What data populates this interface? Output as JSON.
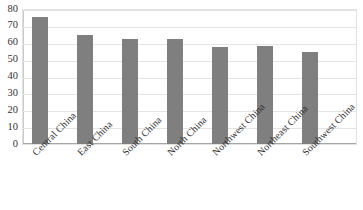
{
  "chart_data": {
    "type": "bar",
    "title": "",
    "xlabel": "",
    "ylabel": "",
    "categories": [
      "Central China",
      "East China",
      "South China",
      "North China",
      "Northwest China",
      "Northeast China",
      "Southwest China"
    ],
    "values": [
      75,
      64.5,
      62,
      62,
      57.5,
      58,
      54.5
    ],
    "ylim": [
      0,
      80
    ],
    "ytick_labels": [
      "80",
      "70",
      "60",
      "50",
      "40",
      "30",
      "20",
      "10",
      "0"
    ],
    "ytick_values": [
      80,
      70,
      60,
      50,
      40,
      30,
      20,
      10,
      0
    ],
    "grid": true,
    "legend": false,
    "bar_color": "#7f7f7f",
    "grid_color": "#e4e4e4",
    "axis_color": "#a6a6a6",
    "background": "#ffffff",
    "xtick_rotation": -45
  }
}
